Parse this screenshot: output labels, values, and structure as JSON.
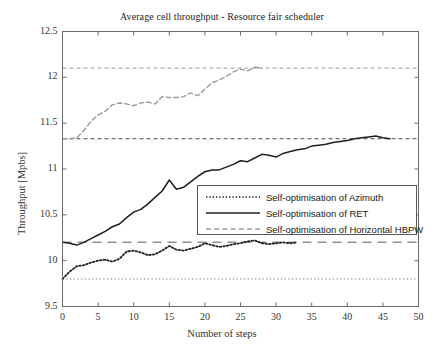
{
  "chart_data": {
    "type": "line",
    "title": "Average cell throughput - Resource fair scheduler",
    "xlabel": "Number of steps",
    "ylabel": "Throughput [Mpbs]",
    "xlim": [
      0,
      50
    ],
    "ylim": [
      9.5,
      12.5
    ],
    "grid": false,
    "legend_position": "center-right",
    "xticks": [
      0,
      5,
      10,
      15,
      20,
      25,
      30,
      35,
      40,
      45,
      50
    ],
    "xtick_labels": [
      "0",
      "5",
      "10",
      "15",
      "20",
      "25",
      "30",
      "35",
      "40",
      "45",
      "50"
    ],
    "yticks": [
      9.5,
      10,
      10.5,
      11,
      11.5,
      12,
      12.5
    ],
    "ytick_labels": [
      "9.5",
      "10",
      "10.5",
      "11",
      "11.5",
      "12",
      "12.5"
    ],
    "reference_lines": [
      {
        "name": "hbpw-target",
        "y": 12.1,
        "style": "dashed",
        "color": "#b0b0b0"
      },
      {
        "name": "ret-target",
        "y": 11.33,
        "style": "dashed",
        "color": "#4a4a4a"
      },
      {
        "name": "baseline",
        "y": 10.2,
        "style": "long-dashed",
        "color": "#909090"
      },
      {
        "name": "azimuth-start",
        "y": 9.8,
        "style": "dotted",
        "color": "#8a8a8a"
      }
    ],
    "series": [
      {
        "name": "Self-optimisation of Azimuth",
        "style": "dotted",
        "color": "#1f1f1f",
        "x": [
          0,
          1,
          2,
          3,
          4,
          5,
          6,
          7,
          8,
          9,
          10,
          11,
          12,
          13,
          14,
          15,
          16,
          17,
          18,
          19,
          20,
          21,
          22,
          23,
          24,
          25,
          26,
          27,
          28,
          29,
          30,
          31,
          32,
          33
        ],
        "values": [
          9.8,
          9.88,
          9.94,
          9.95,
          9.98,
          10.0,
          10.01,
          9.99,
          10.02,
          10.1,
          10.11,
          10.09,
          10.06,
          10.07,
          10.11,
          10.16,
          10.12,
          10.11,
          10.13,
          10.15,
          10.19,
          10.17,
          10.15,
          10.16,
          10.18,
          10.19,
          10.21,
          10.22,
          10.19,
          10.18,
          10.19,
          10.2,
          10.19,
          10.2
        ]
      },
      {
        "name": "Self-optimisation of RET",
        "style": "solid",
        "color": "#1f1f1f",
        "x": [
          0,
          1,
          2,
          3,
          4,
          5,
          6,
          7,
          8,
          9,
          10,
          11,
          12,
          13,
          14,
          15,
          16,
          17,
          18,
          19,
          20,
          21,
          22,
          23,
          24,
          25,
          26,
          27,
          28,
          29,
          30,
          31,
          32,
          33,
          34,
          35,
          36,
          37,
          38,
          39,
          40,
          41,
          42,
          43,
          44,
          45,
          46
        ],
        "values": [
          10.2,
          10.19,
          10.17,
          10.2,
          10.24,
          10.28,
          10.32,
          10.37,
          10.4,
          10.47,
          10.53,
          10.56,
          10.62,
          10.69,
          10.76,
          10.88,
          10.78,
          10.8,
          10.86,
          10.92,
          10.97,
          10.99,
          10.99,
          11.02,
          11.05,
          11.09,
          11.08,
          11.12,
          11.16,
          11.15,
          11.13,
          11.17,
          11.19,
          11.21,
          11.22,
          11.25,
          11.26,
          11.27,
          11.29,
          11.3,
          11.31,
          11.33,
          11.34,
          11.35,
          11.36,
          11.34,
          11.33
        ]
      },
      {
        "name": "Self-optimisation of Horizontal HBPW",
        "style": "dashed",
        "color": "#9a9a9a",
        "x": [
          0,
          1,
          2,
          3,
          4,
          5,
          6,
          7,
          8,
          9,
          10,
          11,
          12,
          13,
          14,
          15,
          16,
          17,
          18,
          19,
          20,
          21,
          22,
          23,
          24,
          25,
          26,
          27,
          28
        ],
        "values": [
          11.33,
          11.33,
          11.34,
          11.42,
          11.52,
          11.59,
          11.63,
          11.7,
          11.72,
          11.71,
          11.69,
          11.72,
          11.73,
          11.71,
          11.79,
          11.78,
          11.78,
          11.79,
          11.83,
          11.8,
          11.87,
          11.94,
          11.97,
          12.01,
          12.06,
          12.09,
          12.07,
          12.11,
          12.1
        ]
      }
    ]
  }
}
